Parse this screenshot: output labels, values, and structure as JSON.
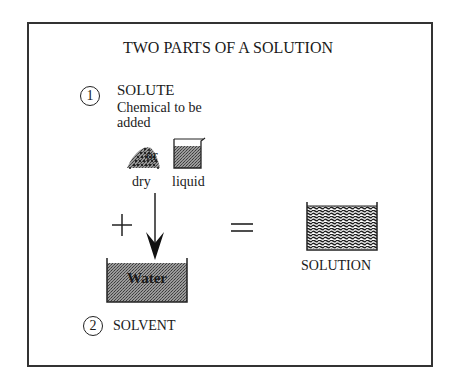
{
  "title": "TWO PARTS OF A SOLUTION",
  "solute": {
    "number": "1",
    "label": "SOLUTE",
    "description": "Chemical to be added",
    "forms": {
      "dry": "dry",
      "connector": "or",
      "liquid": "liquid"
    }
  },
  "operators": {
    "plus": "+",
    "equals": "="
  },
  "solvent": {
    "number": "2",
    "label": "SOLVENT",
    "container_label": "Water"
  },
  "result": {
    "label": "SOLUTION"
  },
  "colors": {
    "line": "#333333",
    "fill_dark": "#7a7a7a",
    "text": "#1a1a1a",
    "background": "#ffffff"
  }
}
